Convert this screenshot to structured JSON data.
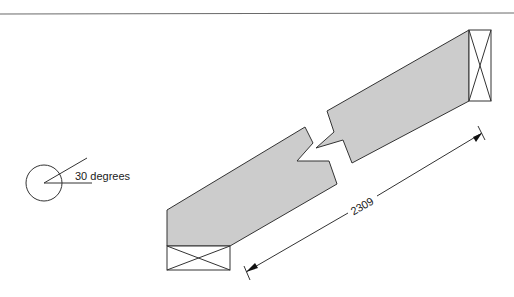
{
  "diagram": {
    "type": "broken-beam-dimension-drawing",
    "angle_label": "30 degrees",
    "dimension_label": "2309",
    "colors": {
      "line": "#333333",
      "fill": "#cccccc",
      "background": "#ffffff"
    }
  }
}
